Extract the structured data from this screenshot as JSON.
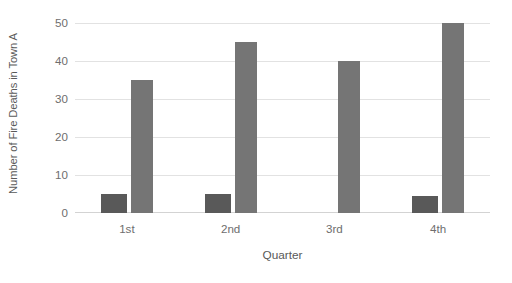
{
  "chart_data": {
    "type": "bar",
    "title": "",
    "subtitle": "",
    "xlabel": "Quarter",
    "ylabel": "Number of Fire Deaths in Town A",
    "categories": [
      "1st",
      "2nd",
      "3rd",
      "4th"
    ],
    "series": [
      {
        "name": "Series 1",
        "values": [
          5,
          5,
          0,
          4.5
        ],
        "color": "#595959"
      },
      {
        "name": "Series 2",
        "values": [
          35,
          45,
          40,
          50
        ],
        "color": "#757575"
      }
    ],
    "ylim": [
      0,
      50
    ],
    "yticks": [
      0,
      10,
      20,
      30,
      40,
      50
    ],
    "ytick_labels": [
      "0",
      "10",
      "20",
      "30",
      "40",
      "50"
    ],
    "grid": "horizontal",
    "legend": "none",
    "background": "#ffffff",
    "gridline_color": "#e2e2e2",
    "axis_color": "#d3d3d3",
    "text_color": "#595959"
  }
}
